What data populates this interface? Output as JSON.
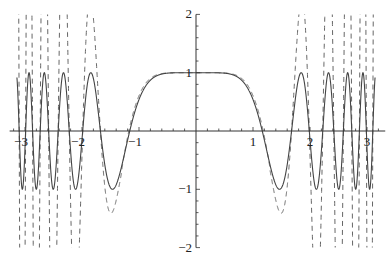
{
  "chart_data": {
    "type": "line",
    "title": "",
    "xlabel": "",
    "ylabel": "",
    "xlim": [
      -3.27,
      3.32
    ],
    "ylim": [
      -2,
      2
    ],
    "grid": false,
    "legend": null,
    "x_ticks": [
      -3,
      -2,
      -1,
      1,
      2,
      3
    ],
    "x_tick_labels": [
      "-3",
      "-2",
      "-1",
      "1",
      "2",
      "3"
    ],
    "y_ticks": [
      -2,
      -1,
      1,
      2
    ],
    "y_tick_labels": [
      "-2",
      "-1",
      "1",
      "2"
    ],
    "domain": [
      -3.14159,
      3.14159
    ],
    "series": [
      {
        "name": "solid",
        "style": "solid",
        "expression": "cos(x^3)",
        "color": "#444444"
      },
      {
        "name": "dashed",
        "style": "dashed",
        "expression": "approximation of cos(x^3) diverging for |x|>1",
        "color": "#666666"
      }
    ],
    "notable_points": {
      "solid_zero_crossings_approx": [
        -1.16,
        1.16,
        1.85,
        -1.85
      ],
      "solid_first_minimum_approx": [
        1.46,
        -1
      ],
      "plateau_value": 1
    }
  }
}
